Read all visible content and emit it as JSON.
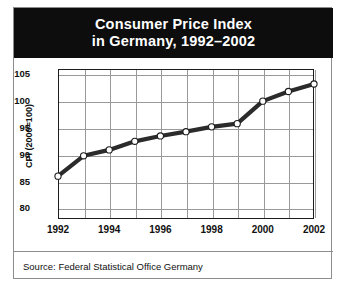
{
  "card": {
    "title_line1": "Consumer Price Index",
    "title_line2": "in Germany, 1992–2002",
    "source": "Source: Federal Statistical Office Germany"
  },
  "chart_data": {
    "type": "line",
    "title": "Consumer Price Index in Germany, 1992–2002",
    "xlabel": "",
    "ylabel": "CPI (2000=100)",
    "x": [
      1992,
      1993,
      1994,
      1995,
      1996,
      1997,
      1998,
      1999,
      2000,
      2001,
      2002
    ],
    "values": [
      86.0,
      89.8,
      90.9,
      92.5,
      93.5,
      94.3,
      95.2,
      95.8,
      100.0,
      101.8,
      103.2
    ],
    "categories": [
      "1992",
      "1993",
      "1994",
      "1995",
      "1996",
      "1997",
      "1998",
      "1999",
      "2000",
      "2001",
      "2002"
    ],
    "ylim": [
      78,
      106
    ],
    "xlim": [
      1992,
      2002
    ],
    "yticks": [
      80,
      85,
      90,
      95,
      100,
      105
    ],
    "ytick_labels": [
      "80",
      "85",
      "90",
      "95",
      "100",
      "105"
    ],
    "xticks": [
      1992,
      1994,
      1996,
      1998,
      2000,
      2002
    ],
    "xtick_labels": [
      "1992",
      "1994",
      "1996",
      "1998",
      "2000",
      "2002"
    ],
    "grid": true,
    "legend": "none",
    "line_color": "#2b2b2b",
    "marker_face_color": "#ffffff",
    "marker_edge_color": "#1c1c1c",
    "background_color": "#ffffff",
    "title_band_color": "#0d0d0d"
  }
}
